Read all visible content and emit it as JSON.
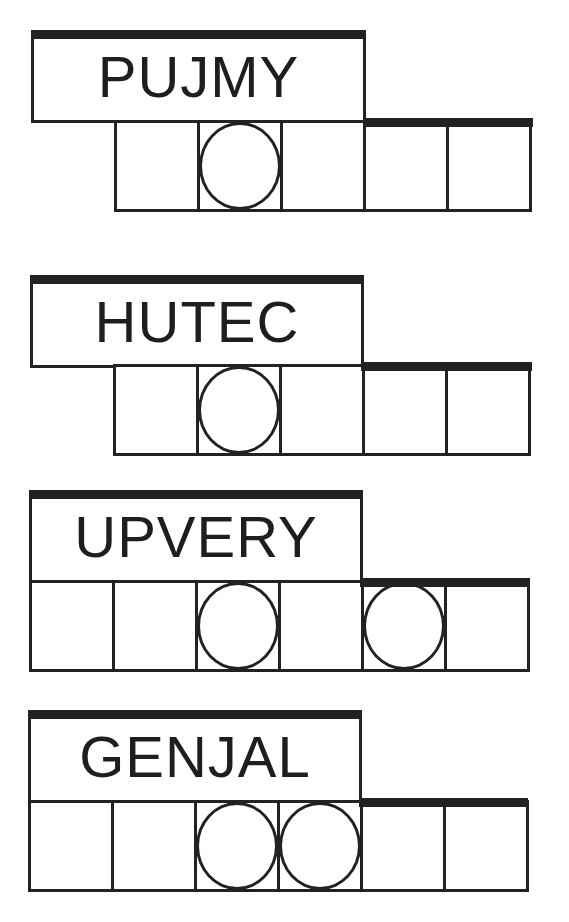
{
  "puzzles": [
    {
      "clue": "PUJMY",
      "tiles": 5,
      "circled": [
        1
      ],
      "box": {
        "x": 31,
        "y": 30,
        "w": 335,
        "h": 93
      },
      "row": {
        "x": 114,
        "y": 120,
        "tile_w": 86,
        "h": 92
      },
      "bar": {
        "x": 363,
        "y": 118,
        "w": 170
      }
    },
    {
      "clue": "HUTEC",
      "tiles": 5,
      "circled": [
        1
      ],
      "box": {
        "x": 30,
        "y": 275,
        "w": 334,
        "h": 93
      },
      "row": {
        "x": 113,
        "y": 364,
        "tile_w": 86,
        "h": 92
      },
      "bar": {
        "x": 361,
        "y": 362,
        "w": 171
      }
    },
    {
      "clue": "UPVERY",
      "tiles": 6,
      "circled": [
        2,
        4
      ],
      "box": {
        "x": 29,
        "y": 490,
        "w": 334,
        "h": 93
      },
      "row": {
        "x": 29,
        "y": 580,
        "tile_w": 86,
        "h": 92
      },
      "bar": {
        "x": 360,
        "y": 578,
        "w": 170
      }
    },
    {
      "clue": "GENJAL",
      "tiles": 6,
      "circled": [
        2,
        3
      ],
      "box": {
        "x": 28,
        "y": 710,
        "w": 334,
        "h": 93
      },
      "row": {
        "x": 28,
        "y": 800,
        "tile_w": 86,
        "h": 92
      },
      "bar": {
        "x": 359,
        "y": 798,
        "w": 169
      }
    }
  ],
  "colors": {
    "ink": "#222222",
    "background": "#ffffff"
  }
}
